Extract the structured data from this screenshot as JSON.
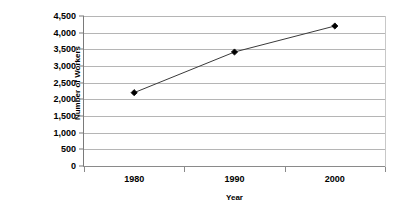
{
  "chart_data": {
    "type": "line",
    "title": "",
    "xlabel": "Year",
    "ylabel": "Number of Workers (in thousands)",
    "ylabel_lines": [
      "Number of Workers",
      "(in thousands)"
    ],
    "categories": [
      "1980",
      "1990",
      "2000"
    ],
    "values": [
      2200,
      3420,
      4200
    ],
    "series": [
      {
        "name": "Number of Workers",
        "values": [
          2200,
          3420,
          4200
        ]
      }
    ],
    "ylim": [
      0,
      4500
    ],
    "ytick_step": 500,
    "ytick_labels": [
      "0",
      "500",
      "1,000",
      "1,500",
      "2,000",
      "2,500",
      "3,000",
      "3,500",
      "4,000",
      "4,500"
    ],
    "ytick_values": [
      0,
      500,
      1000,
      1500,
      2000,
      2500,
      3000,
      3500,
      4000,
      4500
    ],
    "grid": true,
    "grid_axis": "y",
    "legend": false,
    "legend_position": "none",
    "marker": "diamond",
    "colors": {
      "line": "#3a3a3a",
      "marker": "#000000",
      "gridline": "#b5b5b5",
      "axis": "#7a7a7a",
      "text": "#000000",
      "background": "#ffffff"
    }
  }
}
